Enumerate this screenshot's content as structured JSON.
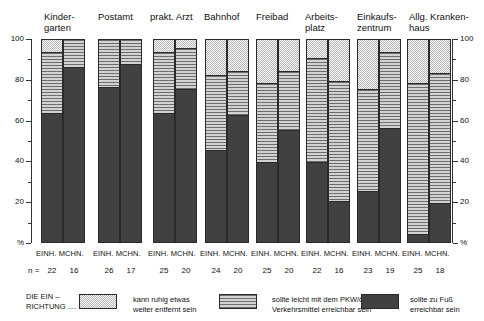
{
  "chart_data": {
    "type": "bar",
    "subtype": "stacked-bar-100-percent",
    "title": "",
    "xlabel": "",
    "ylabel": "%",
    "ylim": [
      0,
      100
    ],
    "y_ticks_major": [
      0,
      20,
      40,
      60,
      80,
      100
    ],
    "y_tick_labels": [
      "%",
      "20",
      "40",
      "60",
      "80",
      "100"
    ],
    "y_minor_step": 10,
    "grid": false,
    "axis_both_sides": true,
    "legend_position": "bottom",
    "categories": [
      "Kinder-\ngarten",
      "Postamt",
      "prakt. Arzt",
      "Bahnhof",
      "Freibad",
      "Arbeits-\nplatz",
      "Einkaufs-\nzentrum",
      "Allg. Kranken-\nhaus"
    ],
    "subcategories": [
      "EINH.",
      "MCHN."
    ],
    "series": [
      {
        "name": "sollte zu Fuß erreichbar sein",
        "pattern": "dark-checker",
        "values_einh": [
          64,
          77,
          64,
          46,
          40,
          40,
          26,
          5
        ],
        "values_mchn": [
          87,
          88,
          76,
          63,
          56,
          21,
          57,
          20
        ]
      },
      {
        "name": "sollte leicht mit dem PKW/öffentl. Verkehrsmittel erreichbar sein",
        "pattern": "horizontal-lines",
        "values_einh": [
          30,
          23,
          30,
          37,
          39,
          51,
          50,
          74
        ],
        "values_mchn": [
          13,
          12,
          20,
          22,
          29,
          59,
          37,
          64
        ]
      },
      {
        "name": "kann ruhig etwas weiter entfernt sein",
        "pattern": "light-checker",
        "values_einh": [
          6,
          0,
          6,
          17,
          21,
          9,
          24,
          21
        ],
        "values_mchn": [
          0,
          0,
          4,
          15,
          15,
          20,
          6,
          16
        ]
      }
    ],
    "n_label_prefix": "n =",
    "n_values_einh": [
      22,
      26,
      25,
      24,
      25,
      22,
      23,
      25
    ],
    "n_values_mchn": [
      16,
      17,
      20,
      20,
      20,
      16,
      19,
      18
    ]
  },
  "legend": {
    "caption": "DIE EIN –\nRICHTUNG ....",
    "items": [
      {
        "label": "kann ruhig etwas\nweiter entfernt sein",
        "pattern": "light-checker"
      },
      {
        "label": "sollte leicht mit dem PKW/öffentl.\nVerkehrsmittel erreichbar sein",
        "pattern": "horizontal-lines"
      },
      {
        "label": "sollte zu Fuß\nerreichbar sein",
        "pattern": "dark-checker"
      }
    ]
  },
  "colors": {
    "light": "#d9d9d9",
    "lines": "#b4b4b4",
    "dark": "#8a8a8a",
    "outline": "#2a2a2a",
    "text": "#111111"
  }
}
